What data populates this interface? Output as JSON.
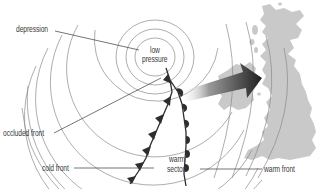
{
  "diagram": {
    "labels": {
      "depression": "depression",
      "low_pressure_line1": "low",
      "low_pressure_line2": "pressure",
      "occluded_front": "occluded front",
      "cold_front": "cold front",
      "warm_sector_line1": "warm",
      "warm_sector_line2": "sector",
      "warm_front": "warm front"
    },
    "elements": {
      "isobars": "concentric-isobars",
      "movement_arrow": "direction-of-movement-arrow",
      "landmass": "british-isles-map"
    },
    "colors": {
      "isobar": "#8a8a8a",
      "land": "#c9c9c9",
      "front": "#2e2e2e",
      "arrow_dark": "#1f1f1f",
      "arrow_light": "#e6e6e6",
      "leader_line": "#3a3a3a"
    }
  }
}
